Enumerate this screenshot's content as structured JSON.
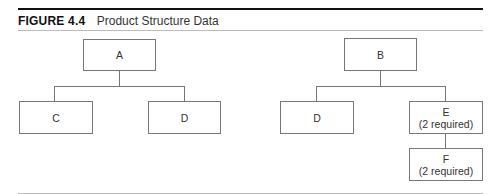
{
  "figure": {
    "label": "FIGURE 4.4",
    "caption": "Product Structure Data"
  },
  "trees": [
    {
      "root": {
        "label": "A",
        "note": ""
      },
      "children": [
        {
          "label": "C",
          "note": ""
        },
        {
          "label": "D",
          "note": ""
        }
      ]
    },
    {
      "root": {
        "label": "B",
        "note": ""
      },
      "children": [
        {
          "label": "D",
          "note": ""
        },
        {
          "label": "E",
          "note": "(2 required)",
          "children": [
            {
              "label": "F",
              "note": "(2 required)"
            }
          ]
        }
      ]
    }
  ]
}
